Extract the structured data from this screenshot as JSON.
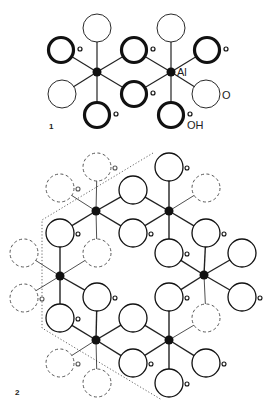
{
  "figure1": {
    "label": "1",
    "atom_labels": {
      "al": "Al",
      "o": "O",
      "oh": "OH"
    },
    "al_nodes": [
      [
        97,
        72
      ],
      [
        171,
        72
      ]
    ],
    "bonds": [
      [
        97,
        72,
        97,
        28
      ],
      [
        97,
        72,
        61,
        50
      ],
      [
        97,
        72,
        134,
        50
      ],
      [
        97,
        72,
        62,
        94
      ],
      [
        97,
        72,
        134,
        94
      ],
      [
        97,
        72,
        97,
        115
      ],
      [
        171,
        72,
        171,
        28
      ],
      [
        171,
        72,
        134,
        50
      ],
      [
        171,
        72,
        207,
        50
      ],
      [
        171,
        72,
        134,
        94
      ],
      [
        171,
        72,
        206,
        94
      ],
      [
        171,
        72,
        171,
        115
      ]
    ],
    "oxygens": [
      {
        "x": 97,
        "y": 28,
        "type": "O"
      },
      {
        "x": 171,
        "y": 28,
        "type": "O"
      },
      {
        "x": 61,
        "y": 50,
        "type": "OH"
      },
      {
        "x": 134,
        "y": 50,
        "type": "OH"
      },
      {
        "x": 207,
        "y": 50,
        "type": "OH"
      },
      {
        "x": 62,
        "y": 94,
        "type": "O"
      },
      {
        "x": 134,
        "y": 94,
        "type": "OH"
      },
      {
        "x": 206,
        "y": 94,
        "type": "O"
      },
      {
        "x": 97,
        "y": 115,
        "type": "OH"
      },
      {
        "x": 171,
        "y": 115,
        "type": "OH"
      }
    ]
  },
  "figure2": {
    "label": "2",
    "al_nodes": [
      [
        96,
        211
      ],
      [
        169,
        211
      ],
      [
        60,
        276
      ],
      [
        204,
        275
      ],
      [
        96,
        340
      ],
      [
        169,
        340
      ]
    ],
    "bonds": [
      [
        96,
        211,
        97,
        167,
        "d"
      ],
      [
        96,
        211,
        60,
        188,
        "d"
      ],
      [
        96,
        211,
        133,
        190,
        "s"
      ],
      [
        96,
        211,
        60,
        233,
        "s"
      ],
      [
        96,
        211,
        133,
        233,
        "s"
      ],
      [
        96,
        211,
        97,
        253,
        "d"
      ],
      [
        169,
        211,
        169,
        167,
        "s"
      ],
      [
        169,
        211,
        206,
        188,
        "d"
      ],
      [
        169,
        211,
        133,
        190,
        "s"
      ],
      [
        169,
        211,
        133,
        233,
        "s"
      ],
      [
        169,
        211,
        206,
        233,
        "s"
      ],
      [
        169,
        211,
        169,
        253,
        "s"
      ],
      [
        60,
        276,
        60,
        233,
        "s"
      ],
      [
        60,
        276,
        24,
        253,
        "d"
      ],
      [
        60,
        276,
        97,
        253,
        "d"
      ],
      [
        60,
        276,
        24,
        298,
        "d"
      ],
      [
        60,
        276,
        97,
        297,
        "s"
      ],
      [
        60,
        276,
        60,
        318,
        "s"
      ],
      [
        204,
        275,
        169,
        253,
        "s"
      ],
      [
        204,
        275,
        242,
        253,
        "s"
      ],
      [
        204,
        275,
        206,
        233,
        "s"
      ],
      [
        204,
        275,
        169,
        297,
        "s"
      ],
      [
        204,
        275,
        242,
        297,
        "s"
      ],
      [
        204,
        275,
        206,
        318,
        "d"
      ],
      [
        96,
        340,
        97,
        297,
        "s"
      ],
      [
        96,
        340,
        60,
        318,
        "s"
      ],
      [
        96,
        340,
        133,
        318,
        "s"
      ],
      [
        96,
        340,
        60,
        363,
        "d"
      ],
      [
        96,
        340,
        133,
        363,
        "s"
      ],
      [
        96,
        340,
        97,
        383,
        "d"
      ],
      [
        169,
        340,
        169,
        297,
        "s"
      ],
      [
        169,
        340,
        133,
        318,
        "s"
      ],
      [
        169,
        340,
        206,
        318,
        "d"
      ],
      [
        169,
        340,
        133,
        363,
        "s"
      ],
      [
        169,
        340,
        206,
        363,
        "s"
      ],
      [
        169,
        340,
        169,
        383,
        "s"
      ]
    ],
    "oxygens": [
      {
        "x": 97,
        "y": 167,
        "style": "dashed",
        "h": true
      },
      {
        "x": 60,
        "y": 188,
        "style": "dashed",
        "h": true
      },
      {
        "x": 133,
        "y": 190,
        "style": "solid",
        "h": false
      },
      {
        "x": 169,
        "y": 167,
        "style": "solid",
        "h": true
      },
      {
        "x": 206,
        "y": 188,
        "style": "dashed",
        "h": false
      },
      {
        "x": 60,
        "y": 233,
        "style": "solid",
        "h": true
      },
      {
        "x": 133,
        "y": 233,
        "style": "solid",
        "h": true
      },
      {
        "x": 97,
        "y": 253,
        "style": "dashed",
        "h": false
      },
      {
        "x": 169,
        "y": 253,
        "style": "solid",
        "h": true
      },
      {
        "x": 206,
        "y": 233,
        "style": "solid",
        "h": true
      },
      {
        "x": 242,
        "y": 253,
        "style": "solid",
        "h": false
      },
      {
        "x": 24,
        "y": 253,
        "style": "dashed",
        "h": false
      },
      {
        "x": 24,
        "y": 298,
        "style": "dashed",
        "h": true
      },
      {
        "x": 97,
        "y": 297,
        "style": "solid",
        "h": true
      },
      {
        "x": 60,
        "y": 318,
        "style": "solid",
        "h": true
      },
      {
        "x": 133,
        "y": 318,
        "style": "solid",
        "h": false
      },
      {
        "x": 169,
        "y": 297,
        "style": "solid",
        "h": true
      },
      {
        "x": 242,
        "y": 297,
        "style": "solid",
        "h": true
      },
      {
        "x": 206,
        "y": 318,
        "style": "dashed",
        "h": false
      },
      {
        "x": 60,
        "y": 363,
        "style": "dashed",
        "h": true
      },
      {
        "x": 133,
        "y": 363,
        "style": "solid",
        "h": true
      },
      {
        "x": 97,
        "y": 383,
        "style": "dashed",
        "h": false
      },
      {
        "x": 169,
        "y": 383,
        "style": "solid",
        "h": true
      },
      {
        "x": 206,
        "y": 363,
        "style": "solid",
        "h": true
      }
    ],
    "unit_cell_outline": [
      [
        153,
        153
      ],
      [
        42,
        220
      ],
      [
        42,
        328
      ],
      [
        162,
        400
      ]
    ]
  }
}
